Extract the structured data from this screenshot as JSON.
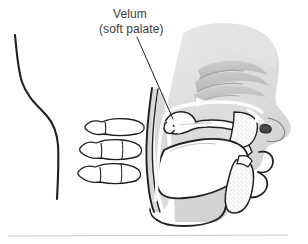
{
  "figure": {
    "name": "sagittal-head-neck-velum-diagram",
    "title_label": "Velum",
    "subtitle_label": "(soft palate)",
    "copyright": "Copyright © Cengage Learning®. All Rights Reserved.",
    "background_color": "#ffffff",
    "text_color": "#3c3c3c",
    "copyright_color": "#9a9a9a",
    "outline_color": "#231f20",
    "tissue_fill": "#d9d9d9",
    "tissue_fill_light": "#e6e6e6",
    "bone_fill": "#ffffff",
    "airflow_arrow_color": "#ffffff",
    "rule_color": "#c9c9c9"
  },
  "anatomy": {
    "parts": [
      {
        "id": "neck-contour",
        "label": "neck and back of head contour"
      },
      {
        "id": "head-tissue",
        "label": "head soft tissue silhouette"
      },
      {
        "id": "nasal-cavity",
        "label": "nasal cavity"
      },
      {
        "id": "nasal-turbinates",
        "label": "nasal turbinates"
      },
      {
        "id": "velum",
        "label": "velum (soft palate)"
      },
      {
        "id": "uvula",
        "label": "uvula"
      },
      {
        "id": "hard-palate",
        "label": "hard palate / maxilla"
      },
      {
        "id": "upper-teeth",
        "label": "upper teeth"
      },
      {
        "id": "tongue",
        "label": "tongue"
      },
      {
        "id": "mandible",
        "label": "mandible"
      },
      {
        "id": "lower-teeth",
        "label": "lower teeth"
      },
      {
        "id": "lips",
        "label": "lips"
      },
      {
        "id": "pharynx",
        "label": "pharyngeal airway"
      },
      {
        "id": "cervical-vertebra-1",
        "label": "cervical vertebra"
      },
      {
        "id": "cervical-vertebra-2",
        "label": "cervical vertebra"
      },
      {
        "id": "cervical-vertebra-3",
        "label": "cervical vertebra"
      }
    ],
    "airflow_arrows": [
      {
        "id": "nasal-airflow-arrow",
        "label": "airflow through nasal cavity"
      },
      {
        "id": "oral-airflow-arrow",
        "label": "airflow through oral cavity"
      },
      {
        "id": "nostril-airflow-arrow",
        "label": "airflow exiting nostril"
      },
      {
        "id": "pharyngeal-airflow-arrow",
        "label": "airflow rising through pharynx"
      }
    ],
    "leader_line": {
      "id": "velum-leader-line",
      "label": "leader line to velum"
    }
  }
}
